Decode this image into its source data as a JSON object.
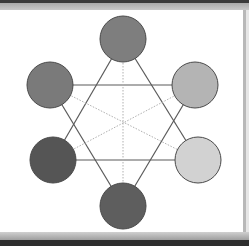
{
  "diagram": {
    "type": "hexagonal-node-graph",
    "nodes": [
      {
        "id": "top",
        "cx": 123,
        "cy": 39,
        "r": 23,
        "fill": "#7e7e7e"
      },
      {
        "id": "upper-left",
        "cx": 50,
        "cy": 85,
        "r": 23,
        "fill": "#7a7a7a"
      },
      {
        "id": "upper-right",
        "cx": 195,
        "cy": 85,
        "r": 23,
        "fill": "#b4b4b4"
      },
      {
        "id": "lower-left",
        "cx": 53,
        "cy": 160,
        "r": 23,
        "fill": "#555555"
      },
      {
        "id": "lower-right",
        "cx": 198,
        "cy": 160,
        "r": 23,
        "fill": "#d2d2d2"
      },
      {
        "id": "bottom",
        "cx": 123,
        "cy": 206,
        "r": 23,
        "fill": "#5e5e5e"
      }
    ],
    "edges": [
      {
        "from": "top",
        "to": "lower-left",
        "style": "solid"
      },
      {
        "from": "top",
        "to": "lower-right",
        "style": "solid"
      },
      {
        "from": "bottom",
        "to": "upper-left",
        "style": "solid"
      },
      {
        "from": "bottom",
        "to": "upper-right",
        "style": "solid"
      },
      {
        "from": "upper-left",
        "to": "upper-right",
        "style": "solid"
      },
      {
        "from": "lower-left",
        "to": "lower-right",
        "style": "solid"
      },
      {
        "from": "top",
        "to": "bottom",
        "style": "dotted"
      },
      {
        "from": "upper-left",
        "to": "lower-right",
        "style": "dotted"
      },
      {
        "from": "lower-left",
        "to": "upper-right",
        "style": "dotted"
      }
    ],
    "colors": {
      "solid_edge": "#5a5a5a",
      "dotted_edge": "#b0b0b0",
      "node_stroke": "#4a4a4a",
      "background": "#ffffff"
    }
  }
}
